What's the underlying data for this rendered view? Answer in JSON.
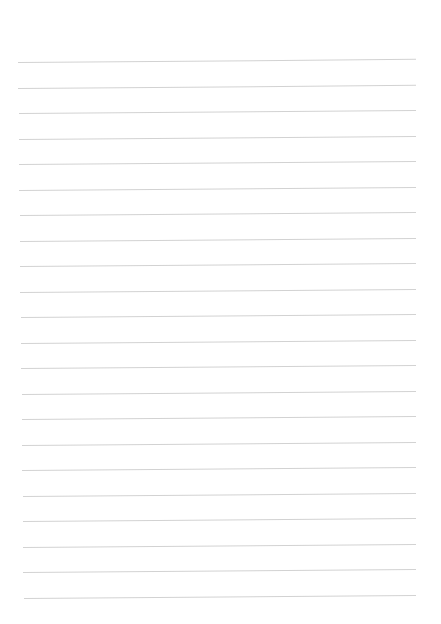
{
  "page": {
    "type": "lined-paper",
    "background": "#ffffff",
    "line_color": "#d2d2d2",
    "line_count": 22,
    "first_line_y": 62,
    "line_spacing": 25.5,
    "line_left": 18,
    "line_right": 416
  }
}
